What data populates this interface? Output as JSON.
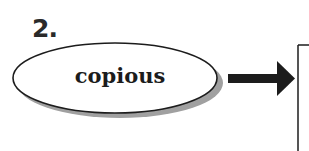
{
  "item": {
    "number": "2.",
    "word": "copious"
  },
  "colors": {
    "ink": "#1c1c1c",
    "shadow": "#9a9a9a",
    "background": "#ffffff"
  },
  "shapes": {
    "oval": "ellipse-with-drop-shadow",
    "arrow": "right-arrow",
    "box": "open-answer-box"
  }
}
